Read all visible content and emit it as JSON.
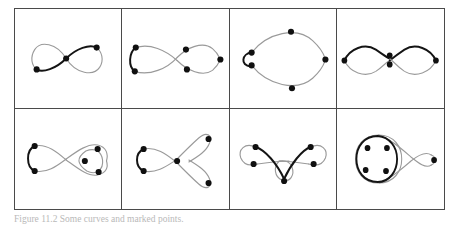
{
  "figure": {
    "caption": "Figure 11.2  Some curves and marked points.",
    "grid": {
      "columns": 4,
      "rows": 2,
      "border_color": "#4a4a4a"
    },
    "colors": {
      "curve_gray": "#9a9a9a",
      "curve_dark": "#141414",
      "node": "#101010",
      "frame": "#4a4a4a",
      "background": "#ffffff"
    },
    "panels": [
      {
        "id": "panel-1",
        "name": "figure-eight-three-nodes",
        "node_count": 3,
        "description": "Lemniscate with one node on lower-left lobe, one at the central crossing, one on upper-right lobe; highlighted dark arc runs from the lower-left node through the crossing to the upper-right node."
      },
      {
        "id": "panel-2",
        "name": "figure-eight-five-nodes",
        "node_count": 5,
        "description": "Lemniscate with two nodes on the left lobe joined by a dark arc, two nodes flanking the crossing, and one node at the far right tip."
      },
      {
        "id": "panel-3",
        "name": "small-loop-large-loop",
        "node_count": 5,
        "description": "Small dark left loop carrying two close nodes, attached to a much larger gray right loop carrying nodes at top, right and bottom."
      },
      {
        "id": "panel-4",
        "name": "double-figure-eight",
        "node_count": 4,
        "description": "Two lemniscates meeting at a shared centre; dark upper arcs and gray lower arcs, with nodes at the left tip, two stacked at the centre, and one at the right tip."
      },
      {
        "id": "panel-5",
        "name": "figure-eight-with-triangle-loop",
        "node_count": 5,
        "description": "Lemniscate with two nodes on the dark left lobe and three nodes arranged in a triangle inside a small extra loop on the right lobe."
      },
      {
        "id": "panel-6",
        "name": "figure-eight-with-two-petals",
        "node_count": 4,
        "description": "Dark left lobe with two nodes; the curve crosses and opens into two gray petals to the upper right and lower right, each ending in a node, with one node at the branch point."
      },
      {
        "id": "panel-7",
        "name": "trefoil-three-lobe",
        "node_count": 5,
        "description": "Three-lobed W-shaped curve with dark central chevron; two nodes on the left lobe, two on the right lobe, one at the bottom of the lower loop."
      },
      {
        "id": "panel-8",
        "name": "circle-with-four-nodes-and-loop",
        "node_count": 5,
        "description": "Dark circle on the left containing four nodes in a diamond arrangement, joined by a gray crossing strand to a small loop on the right ending in a single node."
      }
    ]
  }
}
